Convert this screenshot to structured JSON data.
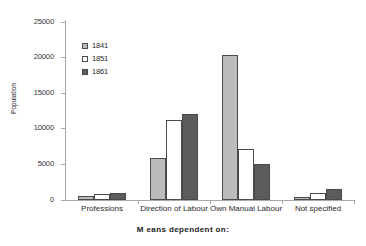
{
  "chart_data": {
    "type": "bar",
    "title": "",
    "xlabel": "M eans dependent on:",
    "ylabel": "Population",
    "categories": [
      "Professions",
      "Direction of Labour",
      "Own Manual Labour",
      "Not specified"
    ],
    "series": [
      {
        "name": "1841",
        "color": "#bcbcbc",
        "values": [
          500,
          5900,
          20400,
          400
        ]
      },
      {
        "name": "1851",
        "color": "#ffffff",
        "values": [
          900,
          11300,
          7200,
          1000
        ]
      },
      {
        "name": "1861",
        "color": "#5c5c5c",
        "values": [
          1000,
          12100,
          5000,
          1500
        ]
      }
    ],
    "ylim": [
      0,
      25000
    ],
    "yticks": [
      0,
      5000,
      10000,
      15000,
      20000,
      25000
    ],
    "ytick_labels": [
      "0",
      "5000",
      "10000",
      "15000",
      "20000",
      "25000"
    ],
    "grid": false,
    "legend_position": "inside-top-left"
  }
}
